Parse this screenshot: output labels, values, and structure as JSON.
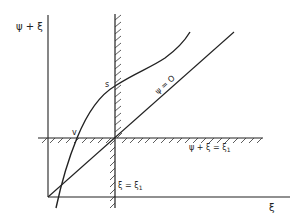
{
  "figure": {
    "y_axis_label": "ψ + ξ",
    "x_axis_label": "ξ",
    "line_psi_zero_label": "ψ = O",
    "vertical_barrier_label_main": "ξ = ξ",
    "vertical_barrier_label_sub": "1",
    "horizontal_barrier_label_main": "ψ + ξ = ξ",
    "horizontal_barrier_label_sub": "1",
    "point_s_label": "s",
    "point_v_label": "v",
    "colors": {
      "ink": "#222222",
      "background": "#ffffff"
    }
  }
}
